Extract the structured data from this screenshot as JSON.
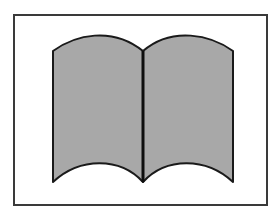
{
  "image": {
    "subject": "open-book-icon",
    "frame_color": "#3a3a3a",
    "page_fill_color": "#a8a8a8",
    "outline_color": "#1a1a1a",
    "background_color": "#ffffff"
  }
}
